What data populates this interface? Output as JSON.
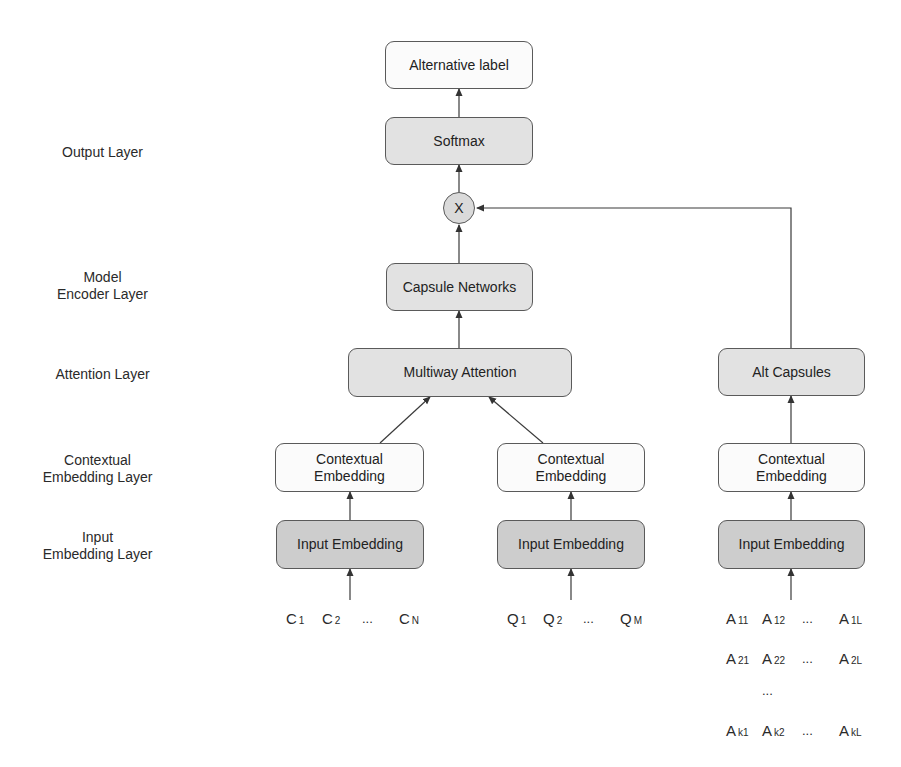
{
  "layer_labels": {
    "output": "Output Layer",
    "model_encoder": [
      "Model",
      "Encoder Layer"
    ],
    "attention": "Attention Layer",
    "contextual": [
      "Contextual",
      "Embedding Layer"
    ],
    "input": [
      "Input",
      "Embedding Layer"
    ]
  },
  "nodes": {
    "alternative_label": "Alternative label",
    "softmax": "Softmax",
    "multiply": "X",
    "capsule_networks": "Capsule Networks",
    "multiway_attention": "Multiway Attention",
    "alt_capsules": "Alt Capsules",
    "contextual_embedding": [
      "Contextual",
      "Embedding"
    ],
    "input_embedding": "Input Embedding"
  },
  "inputs": {
    "context": [
      {
        "base": "C",
        "sub": "1"
      },
      {
        "base": "C",
        "sub": "2"
      },
      {
        "base": "...",
        "sub": ""
      },
      {
        "base": "C",
        "sub": "N"
      }
    ],
    "question": [
      {
        "base": "Q",
        "sub": "1"
      },
      {
        "base": "Q",
        "sub": "2"
      },
      {
        "base": "...",
        "sub": ""
      },
      {
        "base": "Q",
        "sub": "M"
      }
    ],
    "alternatives": [
      [
        {
          "base": "A",
          "sub": "11"
        },
        {
          "base": "A",
          "sub": "12"
        },
        {
          "base": "...",
          "sub": ""
        },
        {
          "base": "A",
          "sub": "1L"
        }
      ],
      [
        {
          "base": "A",
          "sub": "21"
        },
        {
          "base": "A",
          "sub": "22"
        },
        {
          "base": "...",
          "sub": ""
        },
        {
          "base": "A",
          "sub": "2L"
        }
      ],
      [
        {
          "base": "",
          "sub": ""
        },
        {
          "base": "...",
          "sub": ""
        },
        {
          "base": "",
          "sub": ""
        },
        {
          "base": "",
          "sub": ""
        }
      ],
      [
        {
          "base": "A",
          "sub": "k1"
        },
        {
          "base": "A",
          "sub": "k2"
        },
        {
          "base": "...",
          "sub": ""
        },
        {
          "base": "A",
          "sub": "kL"
        }
      ]
    ]
  },
  "colors": {
    "line": "#3a3a3a",
    "box_white": "#fbfbfb",
    "box_light": "#e2e2e2",
    "box_dark": "#cdcdcd"
  }
}
